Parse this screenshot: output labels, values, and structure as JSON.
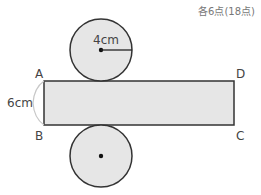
{
  "header": {
    "score_label": "各6点(18点)"
  },
  "figure": {
    "type": "cylinder-net",
    "rectangle": {
      "vertices": {
        "top_left": "A",
        "top_right": "D",
        "bottom_right": "C",
        "bottom_left": "B"
      },
      "height_label": "6cm"
    },
    "top_circle": {
      "radius_label": "4cm"
    },
    "bottom_circle": {
      "radius_label": ""
    },
    "colors": {
      "fill": "#e6e6e6",
      "stroke": "#333333",
      "brace": "#c8c8c8"
    }
  }
}
